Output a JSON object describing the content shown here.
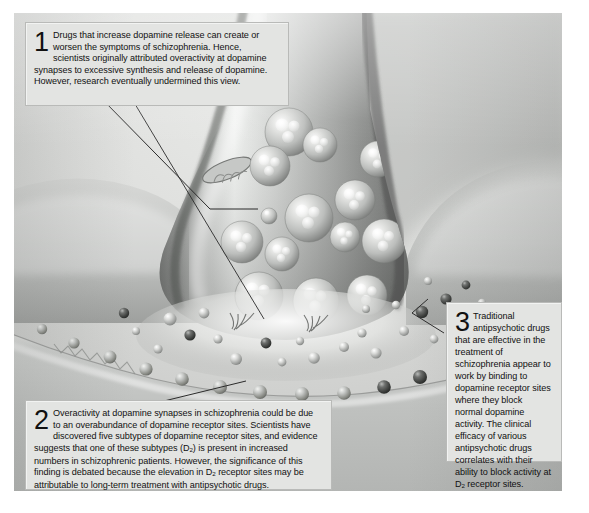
{
  "figure": {
    "style": "grayscale scientific illustration",
    "colors": {
      "plate_background": "#d8d9d7",
      "callout_background": "#e3e4e2",
      "callout_border": "#b9bab8",
      "text": "#111111",
      "leader_line": "#2b2b2b",
      "page_background": "#ffffff"
    }
  },
  "callouts": [
    {
      "number": "1",
      "text": "Drugs that increase dopamine release can create or worsen the symptoms of schizophrenia. Hence, scientists originally attributed overactivity at dopamine synapses to excessive synthesis and release of dopamine. However, research eventually undermined this view."
    },
    {
      "number": "2",
      "text_head": "Overactivity at dopamine synapses in schizophrenia could be due to an overabundance of dopamine receptor sites. Scientists have discovered five subtypes of dopamine receptor sites, and evidence suggests that one of these subtypes (D",
      "sub_1": "2",
      "text_mid": ") is present in increased numbers in schizophrenic patients. However, the significance of this finding is debated because the elevation in D",
      "sub_2": "2",
      "text_tail": " receptor sites may be attributable to long-term treatment with antipsychotic drugs."
    },
    {
      "number": "3",
      "text_head": "Traditional antipsychotic drugs that are effective in the treatment of schizophrenia appear to work by binding to dopamine receptor sites where they block normal dopamine activity. The clinical efficacy of various antipsychotic drugs correlates with their ability to block activity at D",
      "sub_1": "2",
      "text_tail": " receptor sites."
    }
  ],
  "illustration": {
    "parts": [
      {
        "name": "presynaptic-axon-terminal",
        "label": ""
      },
      {
        "name": "synaptic-vesicle",
        "label": ""
      },
      {
        "name": "neurotransmitter-molecule",
        "label": ""
      },
      {
        "name": "synaptic-cleft",
        "label": ""
      },
      {
        "name": "postsynaptic-membrane",
        "label": ""
      },
      {
        "name": "dopamine-receptor-site",
        "label": ""
      },
      {
        "name": "mitochondrion",
        "label": ""
      }
    ]
  }
}
